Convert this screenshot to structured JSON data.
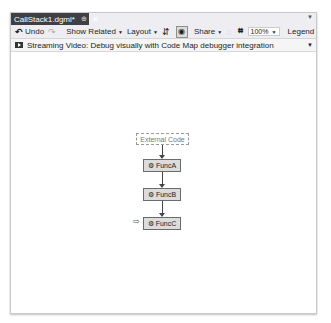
{
  "tab": {
    "title": "CallStack1.dgml*",
    "pin_icon": "pin-icon",
    "close_icon": "close-icon"
  },
  "toolbar": {
    "undo_label": "Undo",
    "redo_icon": "redo-icon",
    "show_related_label": "Show Related",
    "layout_label": "Layout",
    "share_label": "Share",
    "zoom_value": "100%",
    "legend_label": "Legend"
  },
  "infobar": {
    "text": "Streaming Video: Debug visually with Code Map debugger integration"
  },
  "graph": {
    "nodes": [
      {
        "label": "External Code",
        "type": "external"
      },
      {
        "label": "FuncA",
        "type": "function"
      },
      {
        "label": "FuncB",
        "type": "function"
      },
      {
        "label": "FuncC",
        "type": "function",
        "current": true
      }
    ],
    "edges": [
      [
        "External Code",
        "FuncA"
      ],
      [
        "FuncA",
        "FuncB"
      ],
      [
        "FuncB",
        "FuncC"
      ]
    ]
  },
  "colors": {
    "tab_active": "#3f3f46",
    "frame_bg": "#eeeef2",
    "node_fill": "#dcdcdc",
    "node_border": "#6b6b6b"
  }
}
